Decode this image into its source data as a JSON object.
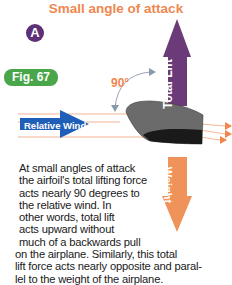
{
  "title": "Small angle of attack",
  "badge": "A",
  "figure_label": "Fig. 67",
  "angle_label": "90°",
  "arrows": {
    "lift": {
      "label": "Total Lift",
      "color": "#6b3a78"
    },
    "weight": {
      "label": "Weight",
      "color": "#f0935a"
    },
    "relative_wind": {
      "label": "Relative Wind",
      "color": "#1f5fb8"
    }
  },
  "caption_lines": [
    "At small angles of attack",
    "the airfoil's total lifting force",
    "acts nearly 90 degrees to",
    "the relative wind. In",
    "other words, total lift",
    "acts upward without",
    "much of a backwards pull",
    "on the airplane. Similarly, this total",
    "lift force acts nearly opposite and paral-",
    "lel to the weight of the airplane."
  ]
}
